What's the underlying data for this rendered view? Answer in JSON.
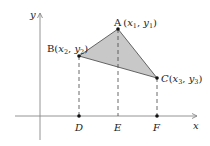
{
  "diagram": {
    "axes": {
      "x_label": "x",
      "y_label": "y"
    },
    "points": {
      "A": {
        "name": "A",
        "x_var": "x",
        "x_sub": "1",
        "y_var": "y",
        "y_sub": "1"
      },
      "B": {
        "name": "B",
        "x_var": "x",
        "x_sub": "2",
        "y_var": "y",
        "y_sub": "2"
      },
      "C": {
        "name": "C",
        "x_var": "x",
        "x_sub": "3",
        "y_var": "y",
        "y_sub": "3"
      }
    },
    "foot_points": {
      "D": "D",
      "E": "E",
      "F": "F"
    },
    "colors": {
      "triangle_fill": "#c8c8c8",
      "line": "#555555",
      "axis": "#888888"
    }
  }
}
